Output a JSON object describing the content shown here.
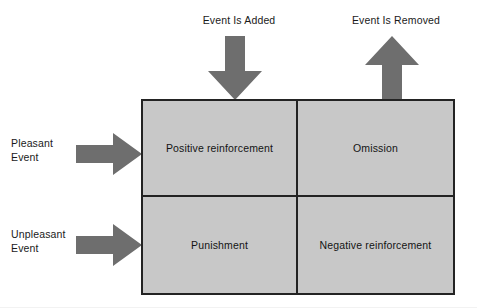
{
  "diagram": {
    "colors": {
      "cell_fill": "#c8c8c8",
      "border": "#232323",
      "arrow": "#6e6e6e",
      "text": "#141414",
      "background": "#ffffff"
    },
    "column_headers": [
      {
        "id": "event-added",
        "label": "Event Is Added",
        "arrow": "arrow-down-icon"
      },
      {
        "id": "event-removed",
        "label": "Event Is Removed",
        "arrow": "arrow-up-icon"
      }
    ],
    "row_headers": [
      {
        "id": "pleasant",
        "line1": "Pleasant",
        "line2": "Event",
        "arrow": "arrow-right-icon"
      },
      {
        "id": "unpleasant",
        "line1": "Unpleasant",
        "line2": "Event",
        "arrow": "arrow-right-icon"
      }
    ],
    "quadrants": [
      {
        "id": "positive-reinforcement",
        "label": "Positive reinforcement",
        "row": "pleasant",
        "column": "event-added"
      },
      {
        "id": "omission",
        "label": "Omission",
        "row": "pleasant",
        "column": "event-removed"
      },
      {
        "id": "punishment",
        "label": "Punishment",
        "row": "unpleasant",
        "column": "event-added"
      },
      {
        "id": "negative-reinforcement",
        "label": "Negative reinforcement",
        "row": "unpleasant",
        "column": "event-removed"
      }
    ]
  }
}
